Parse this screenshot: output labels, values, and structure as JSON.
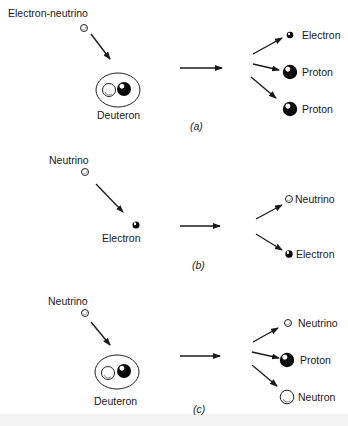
{
  "panels": [
    {
      "caption": "(a)",
      "caption_letter": "a",
      "incoming": "Electron-neutrino",
      "target": "Deuteron",
      "products": [
        "Electron",
        "Proton",
        "Proton"
      ]
    },
    {
      "caption": "(b)",
      "caption_letter": "b",
      "incoming": "Neutrino",
      "target": "Electron",
      "products": [
        "Neutrino",
        "Electron"
      ]
    },
    {
      "caption": "(c)",
      "caption_letter": "c",
      "incoming": "Neutrino",
      "target": "Deuteron",
      "products": [
        "Neutrino",
        "Proton",
        "Neutron"
      ]
    }
  ]
}
